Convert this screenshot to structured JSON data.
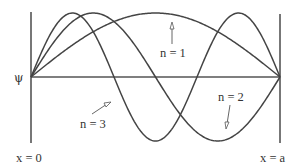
{
  "diagram": {
    "y_axis_label": "ψ",
    "left_wall_label": "x = 0",
    "right_wall_label": "x = a",
    "curves": [
      {
        "n": 1,
        "label": "n = 1",
        "half_wavelengths": 1
      },
      {
        "n": 2,
        "label": "n = 2",
        "half_wavelengths": 2
      },
      {
        "n": 3,
        "label": "n = 3",
        "half_wavelengths": 3
      }
    ],
    "geometry": {
      "x_left": 31,
      "x_right": 280,
      "y_axis": 77,
      "amplitude": 64,
      "wall_top_left": 12,
      "wall_top_right": 14,
      "wall_bottom": 143
    },
    "colors": {
      "line": "#444444",
      "axis": "#555555",
      "text": "#333333"
    }
  }
}
